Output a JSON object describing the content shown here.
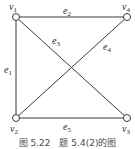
{
  "figure": {
    "caption": "图 5.22　题 5.4(2)的图",
    "colors": {
      "line": "#3a3a3a",
      "node_fill": "#ffffff",
      "text": "#2a2a2a"
    },
    "vertices": [
      {
        "id": "v1",
        "base": "v",
        "sub": "1",
        "x": 16,
        "y": 17
      },
      {
        "id": "v2",
        "base": "v",
        "sub": "2",
        "x": 16,
        "y": 118
      },
      {
        "id": "v3",
        "base": "v",
        "sub": "3",
        "x": 127,
        "y": 118
      },
      {
        "id": "v4",
        "base": "v",
        "sub": "4",
        "x": 127,
        "y": 17
      }
    ],
    "edges": [
      {
        "id": "e1",
        "base": "e",
        "sub": "1",
        "from": "v1",
        "to": "v2"
      },
      {
        "id": "e2",
        "base": "e",
        "sub": "2",
        "from": "v1",
        "to": "v4"
      },
      {
        "id": "e3",
        "base": "e",
        "sub": "3",
        "from": "v1",
        "to": "v3"
      },
      {
        "id": "e4",
        "base": "e",
        "sub": "4",
        "from": "v2",
        "to": "v4"
      },
      {
        "id": "e5",
        "base": "e",
        "sub": "5",
        "from": "v2",
        "to": "v3"
      }
    ]
  }
}
